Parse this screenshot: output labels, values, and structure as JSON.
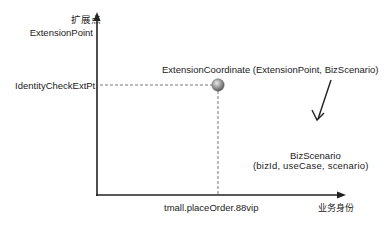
{
  "diagram": {
    "y_axis": {
      "title_cn": "扩展点",
      "title_en": "ExtensionPoint",
      "tick_label": "IdentityCheckExtPt"
    },
    "x_axis": {
      "title_cn": "业务身份",
      "tick_label": "tmall.placeOrder.88vip"
    },
    "point": {
      "label": "ExtensionCoordinate (ExtensionPoint, BizScenario)",
      "color": "#8a8a8a"
    },
    "annotation": {
      "title": "BizScenario",
      "params": "(bizId, useCase, scenario)"
    },
    "colors": {
      "axis": "#222222",
      "dashed": "#555555",
      "background": "#ffffff"
    }
  }
}
